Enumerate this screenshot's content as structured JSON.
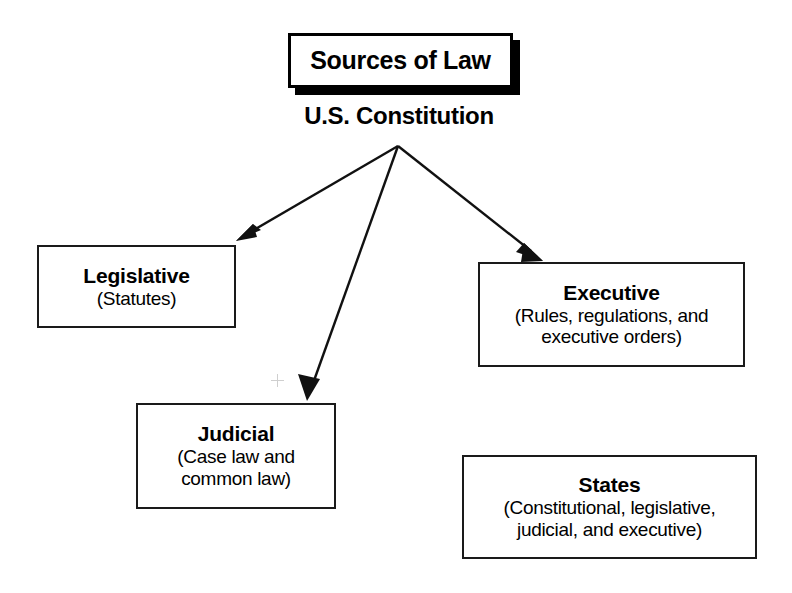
{
  "diagram": {
    "title": "Sources of Law",
    "root": {
      "label": "U.S. Constitution"
    },
    "nodes": [
      {
        "id": "legislative",
        "title": "Legislative",
        "subtitle_lines": [
          "(Statutes)"
        ]
      },
      {
        "id": "executive",
        "title": "Executive",
        "subtitle_lines": [
          "(Rules, regulations, and",
          "executive orders)"
        ]
      },
      {
        "id": "judicial",
        "title": "Judicial",
        "subtitle_lines": [
          "(Case law and",
          "common law)"
        ]
      },
      {
        "id": "states",
        "title": "States",
        "subtitle_lines": [
          "(Constitutional, legislative,",
          "judicial, and executive)"
        ]
      }
    ],
    "connections": [
      {
        "from": "U.S. Constitution",
        "to": "Legislative"
      },
      {
        "from": "U.S. Constitution",
        "to": "Judicial"
      },
      {
        "from": "U.S. Constitution",
        "to": "Executive"
      }
    ],
    "colors": {
      "ink": "#000000",
      "box_border": "#1a1a1a",
      "background": "#ffffff",
      "registration_mark": "#cfcfcf"
    }
  }
}
